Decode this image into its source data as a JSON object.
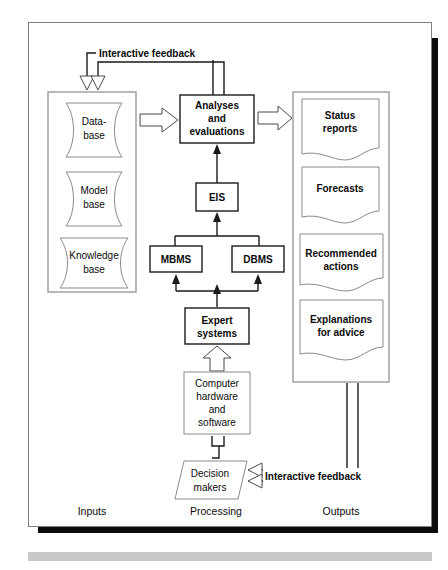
{
  "figure": {
    "type": "block-diagram",
    "sections": {
      "inputs_label": "Inputs",
      "processing_label": "Processing",
      "outputs_label": "Outputs"
    },
    "inputs": [
      {
        "id": "data-base",
        "line1": "Data-",
        "line2": "base",
        "shape": "tape"
      },
      {
        "id": "model-base",
        "line1": "Model",
        "line2": "base",
        "shape": "tape"
      },
      {
        "id": "knowledge-base",
        "line1": "Knowledge",
        "line2": "base",
        "shape": "tape"
      }
    ],
    "processing": [
      {
        "id": "analyses",
        "line1": "Analyses",
        "line2": "and",
        "line3": "evaluations",
        "shape": "rect",
        "bold": true
      },
      {
        "id": "eis",
        "line1": "EIS",
        "shape": "rect",
        "bold": true
      },
      {
        "id": "mbms",
        "line1": "MBMS",
        "shape": "rect",
        "bold": true
      },
      {
        "id": "dbms",
        "line1": "DBMS",
        "shape": "rect",
        "bold": true
      },
      {
        "id": "expert-systems",
        "line1": "Expert",
        "line2": "systems",
        "shape": "rect",
        "bold": true
      },
      {
        "id": "computer-hardware",
        "line1": "Computer",
        "line2": "hardware",
        "line3": "and",
        "line4": "software",
        "shape": "rect",
        "bold": false
      },
      {
        "id": "decision-makers",
        "line1": "Decision",
        "line2": "makers",
        "shape": "parallelogram",
        "bold": false
      }
    ],
    "outputs": [
      {
        "id": "status-reports",
        "line1": "Status",
        "line2": "reports",
        "shape": "document"
      },
      {
        "id": "forecasts",
        "line1": "Forecasts",
        "shape": "document"
      },
      {
        "id": "recommended-actions",
        "line1": "Recommended",
        "line2": "actions",
        "shape": "document"
      },
      {
        "id": "explanations-for-advice",
        "line1": "Explanations",
        "line2": "for advice",
        "shape": "document"
      }
    ],
    "feedback": {
      "top_label": "Interactive feedback",
      "bottom_label": "Interactive feedback"
    },
    "colors": {
      "page_background": "#ffffff",
      "frame_border": "#7f7f7f",
      "shadow": "#0b0b0b",
      "bottom_bar": "#c9c9c9",
      "bold_text": "#0a0a0a",
      "light_text": "#3a3a3a",
      "thin_stroke": "#8a8a8a",
      "thick_stroke": "#1a1a1a"
    }
  }
}
